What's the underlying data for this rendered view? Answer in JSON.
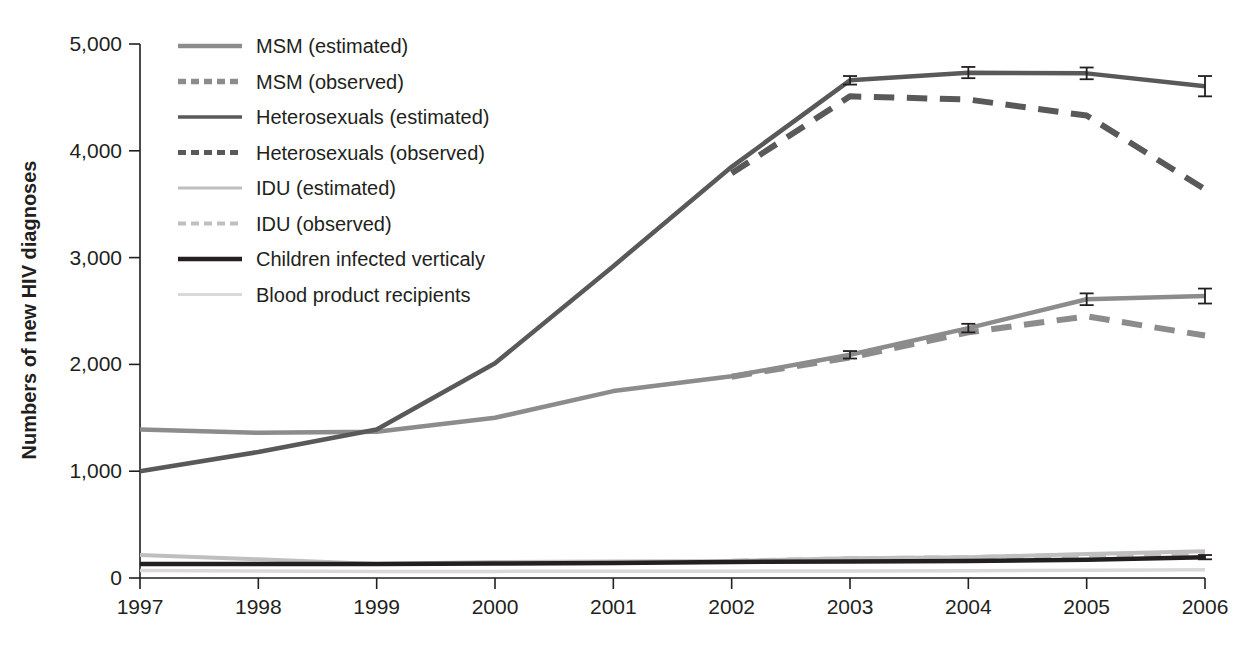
{
  "chart_data": {
    "type": "line",
    "title": "",
    "xlabel": "",
    "ylabel": "Numbers of new HIV diagnoses",
    "x": [
      1997,
      1998,
      1999,
      2000,
      2001,
      2002,
      2003,
      2004,
      2005,
      2006
    ],
    "xtick_labels": [
      "1997",
      "1998",
      "1999",
      "2000",
      "2001",
      "2002",
      "2003",
      "2004",
      "2005",
      "2006"
    ],
    "ytick_labels": [
      "0",
      "1,000",
      "2,000",
      "3,000",
      "4,000",
      "5,000"
    ],
    "ytick_values": [
      0,
      1000,
      2000,
      3000,
      4000,
      5000
    ],
    "xlim": [
      1997,
      2006
    ],
    "ylim": [
      0,
      5000
    ],
    "grid": false,
    "legend_position": "upper-left-inside",
    "series": [
      {
        "name": "MSM (estimated)",
        "legend_label": "MSM (estimated)",
        "style": "solid",
        "color": "#8c8c8c",
        "width": 4.5,
        "x": [
          1997,
          1998,
          1999,
          2000,
          2001,
          2002,
          2003,
          2004,
          2005,
          2006
        ],
        "values": [
          1390,
          1360,
          1370,
          1500,
          1750,
          1890,
          2090,
          2340,
          2610,
          2640
        ],
        "error_bars": [
          {
            "x": 2003,
            "value": 2090,
            "lo": 2055,
            "hi": 2125
          },
          {
            "x": 2004,
            "value": 2340,
            "lo": 2300,
            "hi": 2380
          },
          {
            "x": 2005,
            "value": 2610,
            "lo": 2555,
            "hi": 2665
          },
          {
            "x": 2006,
            "value": 2640,
            "lo": 2570,
            "hi": 2710
          }
        ]
      },
      {
        "name": "MSM (observed)",
        "legend_label": "MSM (observed)",
        "style": "dashed",
        "color": "#8c8c8c",
        "width": 6,
        "x": [
          2002,
          2003,
          2004,
          2005,
          2006
        ],
        "values": [
          1885,
          2065,
          2300,
          2450,
          2270
        ],
        "error_bars": []
      },
      {
        "name": "Heterosexuals (estimated)",
        "legend_label": "Heterosexuals (estimated)",
        "style": "solid",
        "color": "#595959",
        "width": 4.5,
        "x": [
          1997,
          1998,
          1999,
          2000,
          2001,
          2002,
          2003,
          2004,
          2005,
          2006
        ],
        "values": [
          1000,
          1180,
          1390,
          2010,
          2920,
          3850,
          4660,
          4730,
          4725,
          4605
        ],
        "error_bars": [
          {
            "x": 2003,
            "value": 4660,
            "lo": 4620,
            "hi": 4700
          },
          {
            "x": 2004,
            "value": 4730,
            "lo": 4680,
            "hi": 4785
          },
          {
            "x": 2005,
            "value": 4725,
            "lo": 4670,
            "hi": 4780
          },
          {
            "x": 2006,
            "value": 4605,
            "lo": 4510,
            "hi": 4700
          }
        ]
      },
      {
        "name": "Heterosexuals (observed)",
        "legend_label": "Heterosexuals (observed)",
        "style": "dashed",
        "color": "#595959",
        "width": 6,
        "x": [
          2002,
          2003,
          2004,
          2005,
          2006
        ],
        "values": [
          3790,
          4510,
          4480,
          4330,
          3640
        ],
        "error_bars": []
      },
      {
        "name": "IDU (estimated)",
        "legend_label": "IDU (estimated)",
        "style": "solid",
        "color": "#bfbfbf",
        "width": 4,
        "x": [
          1997,
          1998,
          1999,
          2000,
          2001,
          2002,
          2003,
          2004,
          2005,
          2006
        ],
        "values": [
          215,
          175,
          130,
          150,
          155,
          160,
          185,
          195,
          225,
          250
        ],
        "error_bars": []
      },
      {
        "name": "IDU (observed)",
        "legend_label": "IDU (observed)",
        "style": "dashed",
        "color": "#bfbfbf",
        "width": 5,
        "x": [
          2002,
          2003,
          2004,
          2005,
          2006
        ],
        "values": [
          158,
          180,
          190,
          215,
          235
        ],
        "error_bars": []
      },
      {
        "name": "Children infected verticaly",
        "legend_label": "Children infected verticaly",
        "style": "solid",
        "color": "#231f20",
        "width": 4.5,
        "x": [
          1997,
          1998,
          1999,
          2000,
          2001,
          2002,
          2003,
          2004,
          2005,
          2006
        ],
        "values": [
          130,
          130,
          130,
          135,
          140,
          150,
          155,
          160,
          170,
          195
        ],
        "error_bars": [
          {
            "x": 2006,
            "value": 195,
            "lo": 175,
            "hi": 215
          }
        ]
      },
      {
        "name": "Blood product recipients",
        "legend_label": "Blood product recipients",
        "style": "solid",
        "color": "#d9d9d9",
        "width": 3.5,
        "x": [
          1997,
          1998,
          1999,
          2000,
          2001,
          2002,
          2003,
          2004,
          2005,
          2006
        ],
        "values": [
          70,
          65,
          60,
          62,
          63,
          64,
          66,
          68,
          72,
          78
        ],
        "error_bars": []
      }
    ]
  },
  "axis": {
    "y_title": "Numbers of new HIV diagnoses",
    "y_ticks": [
      "5,000",
      "4,000",
      "3,000",
      "2,000",
      "1,000",
      "0"
    ],
    "x_ticks": [
      "1997",
      "1998",
      "1999",
      "2000",
      "2001",
      "2002",
      "2003",
      "2004",
      "2005",
      "2006"
    ]
  },
  "legend": {
    "items": [
      {
        "label": "MSM (estimated)",
        "color": "#8c8c8c",
        "style": "solid",
        "width": 4.5
      },
      {
        "label": "MSM (observed)",
        "color": "#8c8c8c",
        "style": "dashed",
        "width": 5.5
      },
      {
        "label": "Heterosexuals (estimated)",
        "color": "#595959",
        "style": "solid",
        "width": 3.5
      },
      {
        "label": "Heterosexuals (observed)",
        "color": "#595959",
        "style": "dashed",
        "width": 5
      },
      {
        "label": "IDU (estimated)",
        "color": "#bfbfbf",
        "style": "solid",
        "width": 3
      },
      {
        "label": "IDU (observed)",
        "color": "#bfbfbf",
        "style": "dashed",
        "width": 4
      },
      {
        "label": "Children infected verticaly",
        "color": "#231f20",
        "style": "solid",
        "width": 4.5
      },
      {
        "label": "Blood product recipients",
        "color": "#d9d9d9",
        "style": "solid",
        "width": 3
      }
    ]
  }
}
